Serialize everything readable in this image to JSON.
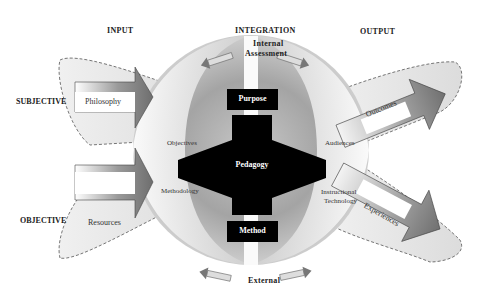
{
  "headers": {
    "input": "INPUT",
    "integration": "INTEGRATION",
    "output": "OUTPUT"
  },
  "rows": {
    "subjective": "SUBJECTIVE",
    "objective": "OBJECTIVE"
  },
  "inputs": {
    "top": "Philosophy",
    "bottom": "Resources"
  },
  "outputs": {
    "top": "Outcomes",
    "bottom": "Experiences"
  },
  "assessment": {
    "internal_line1": "Internal",
    "internal_line2": "Assessment",
    "external": "External"
  },
  "sphere_labels": {
    "objectives": "Objectives",
    "methodology": "Methodology",
    "audiences": "Audiences",
    "instructional_line1": "Instructional",
    "instructional_line2": "Technology"
  },
  "core": {
    "purpose": "Purpose",
    "pedagogy": "Pedagogy",
    "method": "Method"
  },
  "colors": {
    "core_fill": "#000000",
    "sphere_dark": "#8a8a8a",
    "sphere_light": "#e6e6e6",
    "arrow_fill": "#7a7a7a",
    "halo_fill": "#e8e8e8",
    "dash": "#555555"
  }
}
